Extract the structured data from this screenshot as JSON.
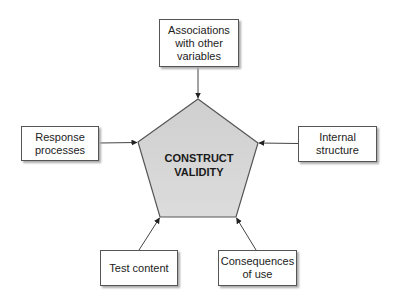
{
  "center": {
    "label": "CONSTRUCT\nVALIDITY",
    "fill": "#d4d4d4"
  },
  "nodes": {
    "top": {
      "label": "Associations\nwith other\nvariables"
    },
    "left": {
      "label": "Response\nprocesses"
    },
    "right": {
      "label": "Internal\nstructure"
    },
    "bottom_left": {
      "label": "Test content"
    },
    "bottom_right": {
      "label": "Consequences\nof use"
    }
  },
  "colors": {
    "stroke": "#444444",
    "box_border": "#555555"
  }
}
